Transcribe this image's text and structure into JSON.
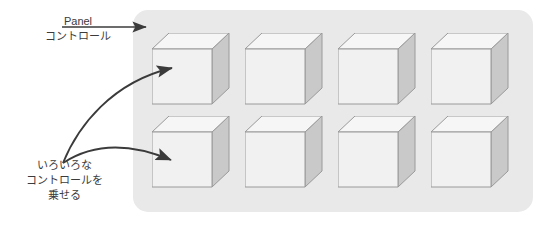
{
  "diagram": {
    "background_color": "#ffffff"
  },
  "panel": {
    "name": "panel-surface",
    "fill_color": "#e9e9e9",
    "corner_radius": 15,
    "rows": 2,
    "columns": 4,
    "cube_count": 8
  },
  "cube": {
    "front_color": "#f1f1f1",
    "top_color": "#f6f6f6",
    "side_color": "#c9c9c9",
    "outline_color": "#9a9a9a"
  },
  "annotations": {
    "panel_label": {
      "lines": [
        "Panel",
        "コントロール"
      ],
      "line1": "Panel",
      "line2": "コントロール"
    },
    "controls_label": {
      "lines": [
        "いろいろな",
        "コントロールを",
        "乗せる"
      ],
      "line1": "いろいろな",
      "line2": "コントロールを",
      "line3": "乗せる"
    }
  },
  "arrows": [
    {
      "name": "panel-pointer-arrow",
      "style": "straight",
      "from": [
        62,
        27
      ],
      "to": [
        150,
        27
      ],
      "color": "#3b3b3b"
    },
    {
      "name": "controls-to-row1-arrow",
      "style": "curved",
      "from": [
        63,
        163
      ],
      "to": [
        180,
        67
      ],
      "color": "#3b3b3b"
    },
    {
      "name": "controls-to-row2-arrow",
      "style": "curved",
      "from": [
        63,
        163
      ],
      "to": [
        179,
        166
      ],
      "color": "#3b3b3b"
    }
  ],
  "cubes": [
    {
      "id": "cube-r1c1",
      "row": 1,
      "column": 1,
      "x": 152,
      "y": 33
    },
    {
      "id": "cube-r1c2",
      "row": 1,
      "column": 2,
      "x": 245,
      "y": 33
    },
    {
      "id": "cube-r1c3",
      "row": 1,
      "column": 3,
      "x": 338,
      "y": 33
    },
    {
      "id": "cube-r1c4",
      "row": 1,
      "column": 4,
      "x": 431,
      "y": 33
    },
    {
      "id": "cube-r2c1",
      "row": 2,
      "column": 1,
      "x": 152,
      "y": 116
    },
    {
      "id": "cube-r2c2",
      "row": 2,
      "column": 2,
      "x": 245,
      "y": 116
    },
    {
      "id": "cube-r2c3",
      "row": 2,
      "column": 3,
      "x": 338,
      "y": 116
    },
    {
      "id": "cube-r2c4",
      "row": 2,
      "column": 4,
      "x": 431,
      "y": 116
    }
  ]
}
